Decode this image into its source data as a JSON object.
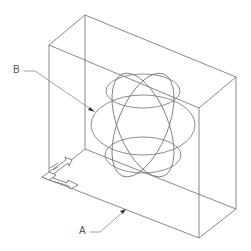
{
  "drawing": {
    "type": "isometric-wireframe",
    "description": "Rectangular box containing a wireframe sphere",
    "labels": {
      "a": "A",
      "b": "B"
    },
    "colors": {
      "line": "#6a6a6a",
      "background": "#ffffff",
      "text": "#555555"
    },
    "icons": {
      "ucs": "ucs-axis-icon"
    }
  }
}
